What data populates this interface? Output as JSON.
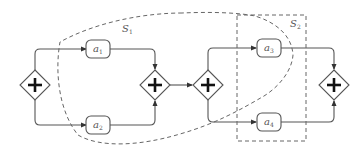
{
  "diagram": {
    "type": "BPMN process model with parallel gateways",
    "tasks": [
      {
        "id": "a1",
        "label": "a",
        "sub": "1"
      },
      {
        "id": "a2",
        "label": "a",
        "sub": "2"
      },
      {
        "id": "a3",
        "label": "a",
        "sub": "3"
      },
      {
        "id": "a4",
        "label": "a",
        "sub": "4"
      }
    ],
    "gateways": [
      {
        "id": "g1",
        "type": "parallel-split",
        "symbol": "+"
      },
      {
        "id": "g2",
        "type": "parallel-join",
        "symbol": "+"
      },
      {
        "id": "g3",
        "type": "parallel-split",
        "symbol": "+"
      },
      {
        "id": "g4",
        "type": "parallel-join",
        "symbol": "+"
      }
    ],
    "regions": [
      {
        "id": "S1",
        "label": "S",
        "sub": "1",
        "shape": "dashed freeform curve"
      },
      {
        "id": "S2",
        "label": "S",
        "sub": "2",
        "shape": "dashed rectangle"
      }
    ],
    "colors": {
      "stroke": "#555555",
      "plus": "#111111",
      "dash": "#666666"
    }
  }
}
